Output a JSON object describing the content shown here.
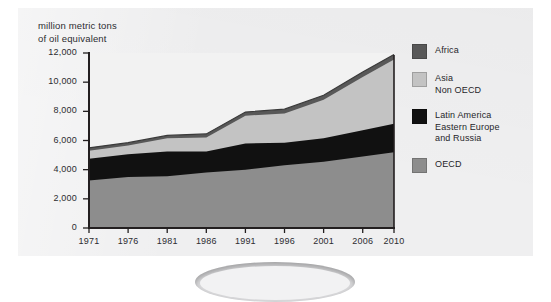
{
  "figure": {
    "caption_line1": "million metric tons",
    "caption_line2": "of oil equivalent"
  },
  "colors": {
    "panel_bg": "#efeff0",
    "plot_bg": "#f2f2f2",
    "axis": "#231f20",
    "oecd": "#8d8d8d",
    "latin_america_eastern_europe_russia": "#111111",
    "asia_non_oecd": "#c3c3c3",
    "africa": "#585858",
    "text": "#2c2c30"
  },
  "legend": {
    "position": "right",
    "items": [
      {
        "label": "Africa",
        "color": "#585858"
      },
      {
        "label": "Asia\nNon OECD",
        "color": "#c3c3c3"
      },
      {
        "label": "Latin America\nEastern Europe\nand Russia",
        "color": "#111111"
      },
      {
        "label": "OECD",
        "color": "#8d8d8d"
      }
    ]
  },
  "chart_data": {
    "type": "area",
    "stacked": true,
    "title": "",
    "subtitle": "",
    "xlabel": "",
    "ylabel": "million metric tons of oil equivalent",
    "grid": false,
    "legend_position": "right",
    "x": [
      1971,
      1976,
      1981,
      1986,
      1991,
      1996,
      2001,
      2006,
      2010
    ],
    "categories": [
      "1971",
      "1976",
      "1981",
      "1986",
      "1991",
      "1996",
      "2001",
      "2006",
      "2010"
    ],
    "xlim": [
      1971,
      2010
    ],
    "ylim": [
      0,
      12000
    ],
    "yticks": [
      0,
      2000,
      4000,
      6000,
      8000,
      10000,
      12000
    ],
    "ytick_labels": [
      "0",
      "2,000",
      "4,000",
      "6,000",
      "8,000",
      "10,000",
      "12,000"
    ],
    "xticks": [
      1971,
      1976,
      1981,
      1986,
      1991,
      1996,
      2001,
      2006,
      2010
    ],
    "xtick_labels": [
      "1971",
      "1976",
      "1981",
      "1986",
      "1991",
      "1996",
      "2001",
      "2006",
      "2010"
    ],
    "series": [
      {
        "name": "OECD",
        "color": "#8d8d8d",
        "values": [
          3250,
          3500,
          3550,
          3800,
          4000,
          4300,
          4550,
          4900,
          5200
        ],
        "cumulative": [
          3250,
          3500,
          3550,
          3800,
          4000,
          4300,
          4550,
          4900,
          5200
        ]
      },
      {
        "name": "Latin America Eastern Europe and Russia",
        "color": "#111111",
        "values": [
          1500,
          1550,
          1700,
          1450,
          1800,
          1550,
          1600,
          1800,
          1950
        ],
        "cumulative": [
          4750,
          5050,
          5250,
          5250,
          5800,
          5850,
          6150,
          6700,
          7150
        ]
      },
      {
        "name": "Asia Non OECD",
        "color": "#c3c3c3",
        "values": [
          550,
          600,
          900,
          950,
          1900,
          2000,
          2650,
          3650,
          4400
        ],
        "cumulative": [
          5300,
          5650,
          6150,
          6200,
          7700,
          7850,
          8800,
          10350,
          11550
        ]
      },
      {
        "name": "Africa",
        "color": "#585858",
        "values": [
          200,
          200,
          200,
          250,
          250,
          300,
          300,
          350,
          350
        ],
        "cumulative": [
          5500,
          5850,
          6350,
          6450,
          7950,
          8150,
          9100,
          10700,
          11900
        ]
      }
    ],
    "totals": [
      5500,
      5850,
      6350,
      6450,
      7950,
      8150,
      9100,
      10700,
      11900
    ]
  }
}
